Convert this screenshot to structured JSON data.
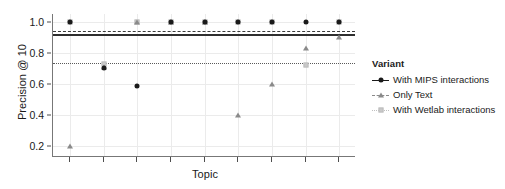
{
  "chart_data": {
    "type": "scatter",
    "title": "",
    "xlabel": "Topic",
    "ylabel": "Precision @ 10",
    "ylim": [
      0.13,
      1.05
    ],
    "yticks": [
      0.2,
      0.4,
      0.6,
      0.8,
      1.0
    ],
    "ytick_labels": [
      "0.2",
      "0.4",
      "0.6",
      "0.8",
      "1.0"
    ],
    "xticks": [
      1,
      2,
      3,
      4,
      5,
      6,
      7,
      8,
      9
    ],
    "xtick_labels": [
      "",
      "",
      "",
      "",
      "",
      "",
      "",
      "",
      ""
    ],
    "grid": true,
    "legend_position": "right",
    "legend_title": "Variant",
    "series": [
      {
        "name": "With MIPS interactions",
        "marker": "circle",
        "color": "#1a1a1a",
        "x": [
          1,
          2,
          3,
          4,
          5,
          6,
          7,
          8,
          9
        ],
        "values": [
          1.0,
          0.7,
          0.59,
          1.0,
          1.0,
          1.0,
          1.0,
          1.0,
          1.0
        ]
      },
      {
        "name": "Only Text",
        "marker": "triangle",
        "color": "#8a8a8a",
        "x": [
          1,
          2,
          3,
          4,
          5,
          6,
          7,
          8,
          9
        ],
        "values": [
          0.2,
          0.71,
          1.0,
          1.0,
          1.0,
          0.4,
          0.6,
          0.83,
          0.9
        ]
      },
      {
        "name": "With Wetlab interactions",
        "marker": "square",
        "color": "#c9c9c9",
        "x": [
          1,
          2,
          3,
          4,
          5,
          6,
          7,
          8,
          9
        ],
        "values": [
          1.0,
          0.73,
          1.0,
          1.0,
          1.0,
          1.0,
          1.0,
          0.72,
          1.0
        ]
      }
    ],
    "reference_lines": [
      {
        "name": "mean-with-mips",
        "style": "solid",
        "value": 0.92,
        "color": "#2f2f2f"
      },
      {
        "name": "mean-with-wetlab",
        "style": "dashed",
        "value": 0.94,
        "color": "#3a3a3a"
      },
      {
        "name": "mean-only-text",
        "style": "dotted",
        "value": 0.735,
        "color": "#5a5a5a"
      }
    ]
  },
  "legend": {
    "title": "Variant",
    "entries": [
      {
        "label": "With MIPS interactions",
        "marker": "circle",
        "line": "solid"
      },
      {
        "label": "Only Text",
        "marker": "triangle",
        "line": "dashed"
      },
      {
        "label": "With Wetlab interactions",
        "marker": "square",
        "line": "dotted"
      }
    ]
  }
}
